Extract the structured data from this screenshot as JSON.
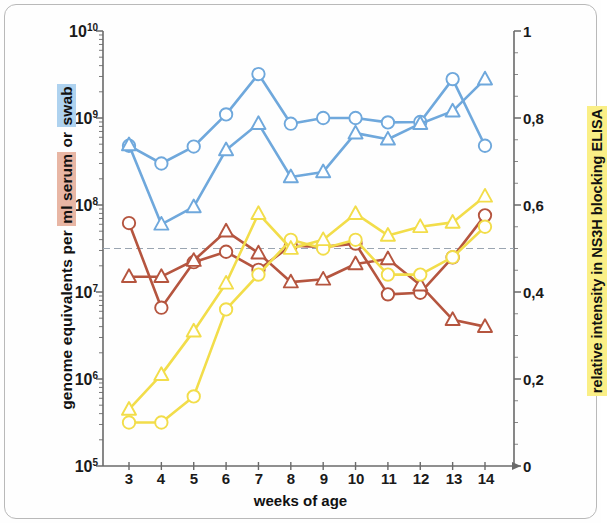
{
  "axes": {
    "left_title_prefix": "genome equivalents per ",
    "left_title_serum": "ml serum",
    "left_title_middle": " or ",
    "left_title_swab": "swab",
    "right_title": "relative intensity in NS3H blocking ELISA",
    "x_title": "weeks of age",
    "left_ticks": [
      "10",
      "10",
      "10",
      "10",
      "10",
      "10"
    ],
    "left_tick_exponents": [
      "10",
      "9",
      "8",
      "7",
      "6",
      "5"
    ],
    "right_ticks": [
      "1",
      "0,8",
      "0,6",
      "0,4",
      "0,2",
      "0"
    ],
    "x_ticks": [
      "3",
      "4",
      "5",
      "6",
      "7",
      "8",
      "9",
      "10",
      "11",
      "12",
      "13",
      "14"
    ]
  },
  "colors": {
    "blue": "#6fa8dc",
    "red": "#b5553f",
    "yellow": "#f2dd4a",
    "axis": "#6a6a6a",
    "dashed": "#9aa5b1",
    "frame": "#b9b9b9",
    "highlight_swab": "#aed2ef",
    "highlight_serum": "#e8b6a4",
    "highlight_elisa": "#faef86"
  },
  "reference_line": {
    "label": "0,5 threshold",
    "right_axis_value": 0.5
  },
  "chart_data": {
    "type": "line",
    "title": "",
    "xlabel": "weeks of age",
    "ylabel": "genome equivalents per ml serum or swab",
    "ylabel_right": "relative intensity in NS3H blocking ELISA",
    "x": [
      3,
      4,
      5,
      6,
      7,
      8,
      9,
      10,
      11,
      12,
      13,
      14
    ],
    "yscale": "log",
    "ylim": [
      100000,
      10000000000
    ],
    "ylim_right": [
      0,
      1
    ],
    "yticks": [
      100000,
      1000000,
      10000000,
      100000000,
      1000000000,
      10000000000
    ],
    "yticks_right": [
      0,
      0.2,
      0.4,
      0.6,
      0.8,
      1
    ],
    "grid": false,
    "legend_position": "none",
    "annotations": [
      {
        "type": "hline",
        "axis": "right",
        "value": 0.5,
        "style": "dashed"
      }
    ],
    "series": [
      {
        "name": "swab (circles)",
        "axis": "left",
        "color": "#6fa8dc",
        "marker": "circle",
        "values": [
          480000000.0,
          300000000.0,
          470000000.0,
          1100000000.0,
          3200000000.0,
          860000000.0,
          1000000000.0,
          1000000000.0,
          890000000.0,
          900000000.0,
          2800000000.0,
          480000000.0
        ]
      },
      {
        "name": "swab (triangles)",
        "axis": "left",
        "color": "#6fa8dc",
        "marker": "triangle",
        "values": [
          490000000.0,
          60000000.0,
          95000000.0,
          430000000.0,
          860000000.0,
          210000000.0,
          240000000.0,
          670000000.0,
          570000000.0,
          860000000.0,
          1200000000.0,
          2800000000.0
        ]
      },
      {
        "name": "serum (circles)",
        "axis": "left",
        "color": "#b5553f",
        "marker": "circle",
        "values": [
          62000000.0,
          6600000.0,
          22000000.0,
          29000000.0,
          18000000.0,
          34000000.0,
          33000000.0,
          36000000.0,
          9400000.0,
          9800000.0,
          25000000.0,
          76000000.0
        ]
      },
      {
        "name": "serum (triangles)",
        "axis": "left",
        "color": "#b5553f",
        "marker": "triangle",
        "values": [
          15000000.0,
          15000000.0,
          23000000.0,
          50000000.0,
          28000000.0,
          13000000.0,
          14000000.0,
          21000000.0,
          24000000.0,
          12000000.0,
          4800000.0,
          4000000.0
        ]
      },
      {
        "name": "ELISA (circles)",
        "axis": "right",
        "color": "#f2dd4a",
        "marker": "circle",
        "values": [
          0.1,
          0.1,
          0.16,
          0.36,
          0.44,
          0.52,
          0.5,
          0.52,
          0.44,
          0.44,
          0.48,
          0.55
        ]
      },
      {
        "name": "ELISA (triangles)",
        "axis": "right",
        "color": "#f2dd4a",
        "marker": "triangle",
        "values": [
          0.13,
          0.21,
          0.31,
          0.42,
          0.58,
          0.5,
          0.52,
          0.58,
          0.53,
          0.55,
          0.56,
          0.62
        ]
      }
    ]
  }
}
